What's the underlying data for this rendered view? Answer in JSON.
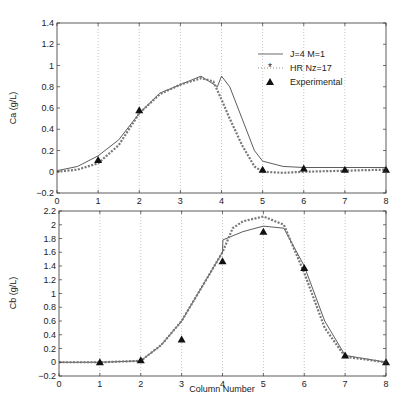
{
  "chart_data": [
    {
      "type": "line",
      "title": "",
      "xlabel": "",
      "ylabel": "Ca (g/L)",
      "xlim": [
        0,
        8
      ],
      "ylim": [
        -0.2,
        1.4
      ],
      "xticks": [
        0,
        1,
        2,
        3,
        4,
        5,
        6,
        7,
        8
      ],
      "yticks": [
        -0.2,
        0,
        0.2,
        0.4,
        0.6,
        0.8,
        1,
        1.2,
        1.4
      ],
      "grid": "x-dotted",
      "legend": {
        "position": "upper right",
        "entries": [
          "J=4 M=1",
          "HR Nz=17",
          "Experimental"
        ]
      },
      "series": [
        {
          "name": "J=4 M=1",
          "style": "solid-line",
          "x": [
            0,
            0.5,
            1,
            1.5,
            2,
            2.5,
            3,
            3.5,
            3.9,
            4.0,
            4.2,
            4.5,
            4.8,
            5,
            5.5,
            6,
            7,
            8
          ],
          "y": [
            0.01,
            0.05,
            0.15,
            0.3,
            0.55,
            0.74,
            0.82,
            0.9,
            0.8,
            0.9,
            0.8,
            0.5,
            0.2,
            0.1,
            0.05,
            0.04,
            0.04,
            0.04
          ]
        },
        {
          "name": "HR Nz=17",
          "style": "dotted-star",
          "x": [
            0,
            0.5,
            1,
            1.5,
            2,
            2.5,
            3,
            3.5,
            3.8,
            4.0,
            4.2,
            4.5,
            4.8,
            5,
            5.5,
            6,
            7,
            8
          ],
          "y": [
            0,
            0.02,
            0.08,
            0.25,
            0.55,
            0.73,
            0.82,
            0.88,
            0.85,
            0.68,
            0.5,
            0.25,
            0.05,
            0.0,
            -0.01,
            0.0,
            0.01,
            0.02
          ]
        },
        {
          "name": "Experimental",
          "style": "triangle",
          "x": [
            1,
            2,
            5,
            6,
            7,
            8
          ],
          "y": [
            0.11,
            0.58,
            0.02,
            0.03,
            0.02,
            0.02
          ]
        }
      ]
    },
    {
      "type": "line",
      "title": "",
      "xlabel": "Column Number",
      "ylabel": "Cb (g/L)",
      "xlim": [
        0,
        8
      ],
      "ylim": [
        -0.2,
        2.2
      ],
      "xticks": [
        0,
        1,
        2,
        3,
        4,
        5,
        6,
        7,
        8
      ],
      "yticks": [
        -0.2,
        0,
        0.2,
        0.4,
        0.6,
        0.8,
        1,
        1.2,
        1.4,
        1.6,
        1.8,
        2,
        2.2
      ],
      "grid": "x-dotted",
      "series": [
        {
          "name": "J=4 M=1",
          "style": "solid-line",
          "x": [
            0,
            1,
            2,
            2.5,
            3,
            3.5,
            4,
            4.01,
            4.5,
            5,
            5.5,
            6,
            6.5,
            7,
            8
          ],
          "y": [
            0,
            0,
            0.02,
            0.25,
            0.6,
            1.1,
            1.6,
            1.78,
            1.9,
            1.98,
            1.95,
            1.4,
            0.6,
            0.1,
            0
          ]
        },
        {
          "name": "HR Nz=17",
          "style": "dotted-star",
          "x": [
            0,
            1,
            2,
            2.5,
            3,
            3.5,
            4,
            4.25,
            4.5,
            5,
            5.5,
            6,
            6.5,
            7,
            8
          ],
          "y": [
            0,
            0,
            0.02,
            0.25,
            0.6,
            1.1,
            1.6,
            1.95,
            2.05,
            2.12,
            2.0,
            1.3,
            0.5,
            0.08,
            0
          ]
        },
        {
          "name": "Experimental",
          "style": "triangle",
          "x": [
            1,
            2,
            3,
            4,
            5,
            6,
            7,
            8
          ],
          "y": [
            0,
            0.03,
            0.33,
            1.47,
            1.9,
            1.37,
            0.1,
            0
          ]
        }
      ]
    }
  ],
  "labels": {
    "top_ylabel": "Ca (g/L)",
    "bottom_ylabel": "Cb (g/L)",
    "bottom_xlabel": "Column Number",
    "legend_1": "J=4 M=1",
    "legend_2": "HR Nz=17",
    "legend_3": "Experimental"
  }
}
